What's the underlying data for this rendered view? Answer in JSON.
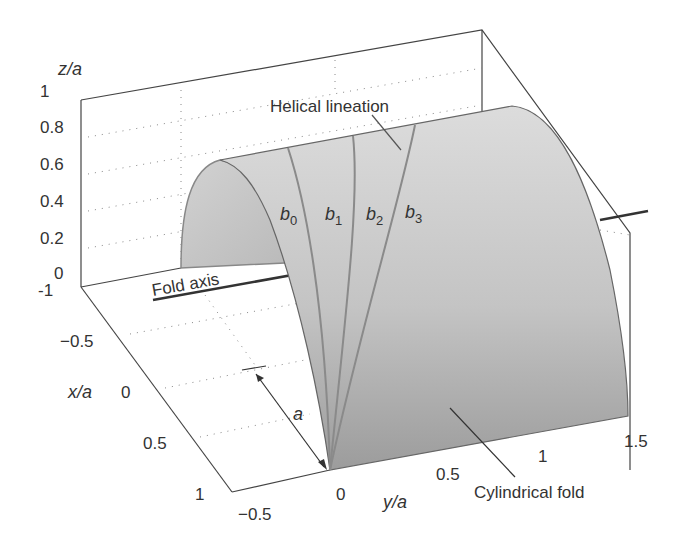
{
  "figure": {
    "type": "3d-surface-diagram",
    "axes": {
      "z": {
        "label": "z/a",
        "ticks": [
          "1",
          "0.8",
          "0.6",
          "0.4",
          "0.2",
          "0"
        ]
      },
      "x": {
        "label": "x/a",
        "ticks": [
          "-1",
          "−0.5",
          "0",
          "0.5",
          "1"
        ]
      },
      "y": {
        "label": "y/a",
        "ticks": [
          "−0.5",
          "0",
          "0.5",
          "1",
          "1.5"
        ]
      }
    },
    "labels": {
      "helical": "Helical lineation",
      "fold_axis": "Fold axis",
      "cylindrical": "Cylindrical fold",
      "radius": "a",
      "b0": "b",
      "b0_sub": "0",
      "b1": "b",
      "b1_sub": "1",
      "b2": "b",
      "b2_sub": "2",
      "b3": "b",
      "b3_sub": "3"
    },
    "colors": {
      "surface_light": "#d4d4d4",
      "surface_dark": "#9a9a9a",
      "inner": "#c8c8c8",
      "line": "#444444",
      "helix": "#8a8a8a"
    }
  },
  "z_tick_minus1": "−1"
}
